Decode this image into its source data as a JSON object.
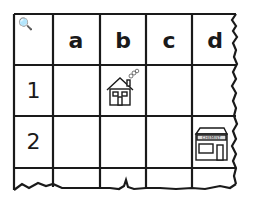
{
  "grid": {
    "corner_symbol": "🔍",
    "columns": [
      "a",
      "b",
      "c",
      "d"
    ],
    "rows": [
      "1",
      "2"
    ],
    "items": [
      {
        "name": "house",
        "row": "1",
        "column": "b",
        "icon": "house-icon"
      },
      {
        "name": "shop",
        "row": "2",
        "column": "d",
        "icon": "shop-icon",
        "sign": "CHEMIST"
      }
    ]
  }
}
